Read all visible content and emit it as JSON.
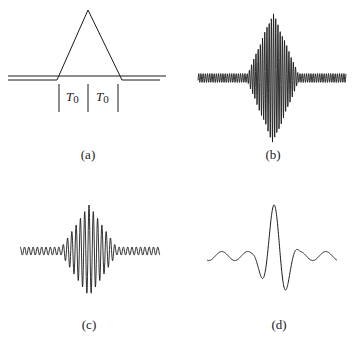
{
  "panels": [
    {
      "id": "a",
      "label": "(a)",
      "description": "triangular envelope of width 2T0",
      "annotations": [
        "T",
        "0",
        "T",
        "0"
      ]
    },
    {
      "id": "b",
      "label": "(b)",
      "description": "high-frequency carrier modulated by triangular envelope"
    },
    {
      "id": "c",
      "label": "(c)",
      "description": "lower-frequency modulated wave packet"
    },
    {
      "id": "d",
      "label": "(d)",
      "description": "low-frequency wavelet-like pulse"
    }
  ],
  "colors": {
    "line": "#1a1a1a",
    "background": "#ffffff"
  }
}
